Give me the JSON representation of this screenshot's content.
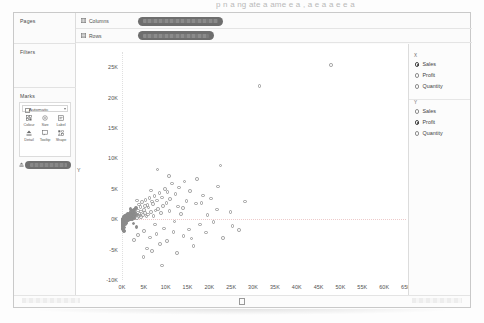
{
  "page": {
    "top_clipped_text": "p      n  a ng  ate  a  ame    e a  ,  a  e  a   a  e  e  a"
  },
  "sidebar": {
    "pages": {
      "title": "Pages"
    },
    "filters": {
      "title": "Filters"
    },
    "marks": {
      "title": "Marks",
      "mark_type": "Automatic",
      "buttons": [
        {
          "label": "Colour",
          "icon": "colour-icon"
        },
        {
          "label": "Size",
          "icon": "size-icon"
        },
        {
          "label": "Label",
          "icon": "label-icon"
        },
        {
          "label": "Detail",
          "icon": "detail-icon"
        },
        {
          "label": "Tooltip",
          "icon": "tooltip-icon"
        },
        {
          "label": "Shape",
          "icon": "shape-icon"
        }
      ],
      "pill": {
        "label": "",
        "redacted": true,
        "icon": "detail-pill-icon"
      }
    }
  },
  "shelves": [
    {
      "name": "Columns",
      "label": "Columns",
      "pill_label": "",
      "pill_redacted": true,
      "pill_width": 85
    },
    {
      "name": "Rows",
      "label": "Rows",
      "pill_label": "",
      "pill_redacted": true,
      "pill_width": 76
    }
  ],
  "right_panel": {
    "groups": [
      {
        "header": "X",
        "options": [
          {
            "label": "Sales",
            "selected": true
          },
          {
            "label": "Profit",
            "selected": false
          },
          {
            "label": "Quantity",
            "selected": false
          }
        ]
      },
      {
        "header": "Y",
        "options": [
          {
            "label": "Sales",
            "selected": false
          },
          {
            "label": "Profit",
            "selected": true
          },
          {
            "label": "Quantity",
            "selected": false
          }
        ]
      }
    ]
  },
  "chart_data": {
    "type": "scatter",
    "title": "",
    "xlabel": "X",
    "ylabel": "Y",
    "xlim": [
      0,
      65000
    ],
    "ylim": [
      -10000,
      27500
    ],
    "grid": false,
    "legend": null,
    "xticks": [
      "0K",
      "5K",
      "10K",
      "15K",
      "20K",
      "25K",
      "30K",
      "35K",
      "40K",
      "45K",
      "50K",
      "55K",
      "60K",
      "65K"
    ],
    "xtick_values": [
      0,
      5000,
      10000,
      15000,
      20000,
      25000,
      30000,
      35000,
      40000,
      45000,
      50000,
      55000,
      60000,
      65000
    ],
    "yticks": [
      "25K",
      "20K",
      "15K",
      "10K",
      "5K",
      "0K",
      "-5K",
      "-10K"
    ],
    "ytick_values": [
      25000,
      20000,
      15000,
      10000,
      5000,
      0,
      -5000,
      -10000
    ],
    "marker": "open-circle",
    "marker_color": "#9b9b9b",
    "series": [
      {
        "name": "Product Name",
        "points": [
          [
            47800,
            25400
          ],
          [
            31500,
            21900
          ],
          [
            22500,
            8800
          ],
          [
            17200,
            6600
          ],
          [
            14300,
            6200
          ],
          [
            11500,
            5900
          ],
          [
            13100,
            5200
          ],
          [
            9800,
            5000
          ],
          [
            15600,
            4600
          ],
          [
            10400,
            4500
          ],
          [
            8600,
            4300
          ],
          [
            12200,
            4100
          ],
          [
            18600,
            3900
          ],
          [
            7400,
            3800
          ],
          [
            9100,
            3600
          ],
          [
            6300,
            3500
          ],
          [
            20400,
            3400
          ],
          [
            11000,
            3300
          ],
          [
            5400,
            3200
          ],
          [
            8000,
            3100
          ],
          [
            14800,
            3000
          ],
          [
            6800,
            2900
          ],
          [
            4600,
            2800
          ],
          [
            10200,
            2700
          ],
          [
            16900,
            2600
          ],
          [
            7100,
            2500
          ],
          [
            3900,
            2400
          ],
          [
            5800,
            2300
          ],
          [
            9400,
            2200
          ],
          [
            12800,
            2100
          ],
          [
            4200,
            2000
          ],
          [
            6100,
            1900
          ],
          [
            3200,
            1800
          ],
          [
            8300,
            1700
          ],
          [
            21800,
            1600
          ],
          [
            5000,
            1550
          ],
          [
            2700,
            1500
          ],
          [
            3600,
            1450
          ],
          [
            7700,
            1400
          ],
          [
            10900,
            1350
          ],
          [
            2300,
            1300
          ],
          [
            4400,
            1250
          ],
          [
            6600,
            1200
          ],
          [
            1900,
            1150
          ],
          [
            3000,
            1100
          ],
          [
            5200,
            1050
          ],
          [
            8900,
            1000
          ],
          [
            1600,
            950
          ],
          [
            2500,
            900
          ],
          [
            4000,
            880
          ],
          [
            13500,
            860
          ],
          [
            1300,
            840
          ],
          [
            2100,
            800
          ],
          [
            3400,
            780
          ],
          [
            6000,
            760
          ],
          [
            1100,
            740
          ],
          [
            1800,
            700
          ],
          [
            2900,
            680
          ],
          [
            4800,
            660
          ],
          [
            900,
            640
          ],
          [
            1500,
            600
          ],
          [
            2400,
            580
          ],
          [
            3800,
            560
          ],
          [
            7200,
            540
          ],
          [
            750,
            520
          ],
          [
            1250,
            500
          ],
          [
            2000,
            480
          ],
          [
            3100,
            460
          ],
          [
            5600,
            440
          ],
          [
            620,
            420
          ],
          [
            1050,
            400
          ],
          [
            1700,
            380
          ],
          [
            2600,
            360
          ],
          [
            4300,
            340
          ],
          [
            520,
            320
          ],
          [
            880,
            300
          ],
          [
            1400,
            280
          ],
          [
            2200,
            260
          ],
          [
            3500,
            240
          ],
          [
            430,
            220
          ],
          [
            730,
            200
          ],
          [
            1150,
            180
          ],
          [
            1850,
            160
          ],
          [
            2850,
            140
          ],
          [
            360,
            120
          ],
          [
            600,
            100
          ],
          [
            950,
            90
          ],
          [
            1550,
            80
          ],
          [
            2400,
            70
          ],
          [
            300,
            60
          ],
          [
            500,
            50
          ],
          [
            800,
            40
          ],
          [
            1300,
            30
          ],
          [
            2050,
            20
          ],
          [
            250,
            10
          ],
          [
            420,
            0
          ],
          [
            670,
            -10
          ],
          [
            1080,
            -20
          ],
          [
            1720,
            -30
          ],
          [
            210,
            -40
          ],
          [
            350,
            -55
          ],
          [
            560,
            -70
          ],
          [
            900,
            -85
          ],
          [
            1450,
            -100
          ],
          [
            175,
            -120
          ],
          [
            290,
            -140
          ],
          [
            470,
            -160
          ],
          [
            760,
            -180
          ],
          [
            1220,
            -200
          ],
          [
            145,
            -230
          ],
          [
            240,
            -260
          ],
          [
            390,
            -290
          ],
          [
            630,
            -320
          ],
          [
            1020,
            -360
          ],
          [
            120,
            -400
          ],
          [
            200,
            -440
          ],
          [
            325,
            -480
          ],
          [
            525,
            -530
          ],
          [
            850,
            -580
          ],
          [
            100,
            -640
          ],
          [
            165,
            -700
          ],
          [
            270,
            -760
          ],
          [
            440,
            -830
          ],
          [
            710,
            -900
          ],
          [
            85,
            -980
          ],
          [
            140,
            -1060
          ],
          [
            225,
            -1150
          ],
          [
            365,
            -1240
          ],
          [
            590,
            -1340
          ],
          [
            70,
            -1450
          ],
          [
            115,
            -1560
          ],
          [
            190,
            -1680
          ],
          [
            305,
            -1800
          ],
          [
            490,
            -1930
          ],
          [
            9600,
            -1500
          ],
          [
            11800,
            -2100
          ],
          [
            7900,
            -2400
          ],
          [
            6400,
            -3000
          ],
          [
            14100,
            -2800
          ],
          [
            10300,
            -3600
          ],
          [
            8700,
            -4100
          ],
          [
            16400,
            -4400
          ],
          [
            5700,
            -4800
          ],
          [
            12600,
            -5600
          ],
          [
            19200,
            -2200
          ],
          [
            23100,
            -3100
          ],
          [
            4900,
            -6200
          ],
          [
            9200,
            -7600
          ],
          [
            15300,
            -1700
          ],
          [
            17800,
            -900
          ],
          [
            25300,
            -1100
          ],
          [
            20900,
            -500
          ],
          [
            26800,
            -1800
          ],
          [
            6900,
            -5200
          ],
          [
            3700,
            -2600
          ],
          [
            2800,
            -3400
          ],
          [
            5100,
            -1900
          ],
          [
            3300,
            -1300
          ],
          [
            13900,
            1800
          ],
          [
            18200,
            2700
          ],
          [
            22000,
            5400
          ],
          [
            24800,
            1200
          ],
          [
            28200,
            2900
          ],
          [
            10700,
            7100
          ],
          [
            8100,
            8200
          ],
          [
            19600,
            680
          ],
          [
            7500,
            -900
          ],
          [
            4100,
            600
          ],
          [
            2600,
            -700
          ],
          [
            1950,
            1650
          ],
          [
            3400,
            3100
          ],
          [
            6700,
            4700
          ],
          [
            5300,
            2200
          ],
          [
            12000,
            -400
          ],
          [
            15900,
            -3200
          ]
        ]
      }
    ]
  }
}
